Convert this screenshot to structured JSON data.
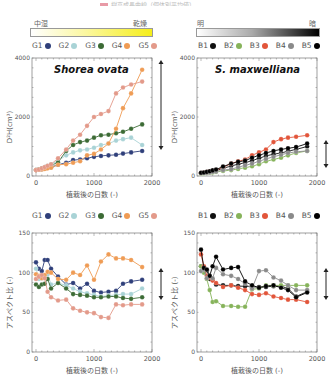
{
  "figure_title": "樹高成長曲線（個体別平均値）",
  "left_panel": {
    "gradient": {
      "left_label": "中湿",
      "right_label": "乾燥",
      "from": "#ffffff",
      "to": "#f5f000"
    },
    "legend": [
      {
        "label": "G1",
        "color": "#2f3f7a"
      },
      {
        "label": "G2",
        "color": "#a9d3d6"
      },
      {
        "label": "G3",
        "color": "#3c6b35"
      },
      {
        "label": "G4",
        "color": "#ef9c55"
      },
      {
        "label": "G5",
        "color": "#e39a8a"
      }
    ]
  },
  "right_panel": {
    "gradient": {
      "left_label": "明",
      "right_label": "暗",
      "from": "#ffffff",
      "to": "#000000"
    },
    "legend": [
      {
        "label": "B1",
        "color": "#111111"
      },
      {
        "label": "B2",
        "color": "#86b35a"
      },
      {
        "label": "B3",
        "color": "#e2553a"
      },
      {
        "label": "B4",
        "color": "#8a8a8a"
      },
      {
        "label": "B5",
        "color": "#000000"
      }
    ]
  },
  "axes_text": {
    "xlabel": "植栽後の日数 (-)",
    "ylabel_top": "D²H(cm³)",
    "ylabel_bottom": "アスペクト比 (-)",
    "x_ticks": [
      "0",
      "1000",
      "2000"
    ],
    "y_ticks_top": [
      "0",
      "2000",
      "4000"
    ],
    "y_ticks_bottom": [
      "0",
      "50",
      "100",
      "150"
    ]
  },
  "chart_data": [
    {
      "type": "line",
      "title": "Shorea ovata",
      "xlabel": "植栽後の日数 (-)",
      "ylabel": "D²H(cm³)",
      "xlim": [
        0,
        2000
      ],
      "ylim": [
        0,
        4000
      ],
      "x": [
        0,
        50,
        100,
        150,
        200,
        260,
        380,
        520,
        640,
        760,
        880,
        1000,
        1120,
        1250,
        1380,
        1500,
        1640,
        1830
      ],
      "series": [
        {
          "name": "G1",
          "color": "#2f3f7a",
          "values": [
            200,
            210,
            230,
            250,
            280,
            300,
            380,
            450,
            540,
            560,
            600,
            650,
            680,
            700,
            720,
            760,
            800,
            850
          ]
        },
        {
          "name": "G2",
          "color": "#a9d3d6",
          "values": [
            200,
            230,
            260,
            300,
            350,
            400,
            520,
            700,
            800,
            870,
            900,
            960,
            1050,
            1100,
            1200,
            1250,
            1300,
            1050
          ]
        },
        {
          "name": "G3",
          "color": "#3c6b35",
          "values": [
            200,
            220,
            250,
            280,
            330,
            360,
            460,
            850,
            1050,
            1150,
            1200,
            1300,
            1380,
            1400,
            1450,
            1500,
            1600,
            1750
          ]
        },
        {
          "name": "G4",
          "color": "#ef9c55",
          "values": [
            200,
            210,
            220,
            240,
            260,
            280,
            380,
            400,
            450,
            500,
            700,
            750,
            900,
            1100,
            1600,
            2300,
            2800,
            3600
          ]
        },
        {
          "name": "G5",
          "color": "#e39a8a",
          "values": [
            200,
            220,
            260,
            300,
            350,
            400,
            600,
            900,
            1200,
            1400,
            1700,
            2000,
            2100,
            2200,
            2800,
            3000,
            3100,
            3200
          ]
        }
      ],
      "annotation": "range arrow (double-headed) at right"
    },
    {
      "type": "line",
      "title": "S. maxwelliana",
      "xlabel": "植栽後の日数 (-)",
      "ylabel": "D²H(cm³)",
      "xlim": [
        0,
        2000
      ],
      "ylim": [
        0,
        4000
      ],
      "x": [
        0,
        50,
        100,
        150,
        200,
        260,
        380,
        520,
        640,
        760,
        880,
        1000,
        1120,
        1250,
        1380,
        1500,
        1640,
        1830
      ],
      "series": [
        {
          "name": "B1",
          "color": "#111111",
          "values": [
            100,
            110,
            120,
            140,
            160,
            180,
            260,
            340,
            400,
            450,
            520,
            600,
            680,
            740,
            780,
            840,
            900,
            1000
          ]
        },
        {
          "name": "B2",
          "color": "#86b35a",
          "values": [
            80,
            90,
            100,
            110,
            120,
            140,
            170,
            200,
            240,
            280,
            330,
            400,
            500,
            560,
            620,
            700,
            780,
            850
          ]
        },
        {
          "name": "B3",
          "color": "#e2553a",
          "values": [
            100,
            110,
            130,
            150,
            180,
            200,
            300,
            420,
            500,
            560,
            700,
            800,
            900,
            1150,
            1250,
            1300,
            1330,
            1380
          ]
        },
        {
          "name": "B4",
          "color": "#8a8a8a",
          "values": [
            90,
            100,
            110,
            120,
            140,
            150,
            200,
            230,
            300,
            360,
            420,
            500,
            580,
            650,
            720,
            780,
            820,
            850
          ]
        },
        {
          "name": "B5",
          "color": "#000000",
          "values": [
            110,
            120,
            140,
            160,
            190,
            220,
            320,
            420,
            480,
            520,
            620,
            700,
            780,
            850,
            900,
            940,
            980,
            1100
          ]
        }
      ],
      "annotation": "range arrow (double-headed) at right"
    },
    {
      "type": "line",
      "title": "",
      "xlabel": "植栽後の日数 (-)",
      "ylabel": "アスペクト比 (-)",
      "xlim": [
        0,
        2000
      ],
      "ylim": [
        0,
        150
      ],
      "x": [
        0,
        50,
        100,
        150,
        200,
        260,
        380,
        520,
        640,
        760,
        880,
        1000,
        1120,
        1250,
        1380,
        1500,
        1640,
        1830
      ],
      "series": [
        {
          "name": "G1",
          "color": "#2f3f7a",
          "values": [
            113,
            105,
            102,
            116,
            116,
            105,
            95,
            85,
            87,
            80,
            86,
            77,
            75,
            76,
            77,
            86,
            89,
            91
          ]
        },
        {
          "name": "G2",
          "color": "#a9d3d6",
          "values": [
            105,
            92,
            93,
            95,
            98,
            85,
            87,
            84,
            80,
            76,
            74,
            72,
            70,
            71,
            72,
            73,
            73,
            80
          ]
        },
        {
          "name": "G3",
          "color": "#3c6b35",
          "values": [
            85,
            82,
            85,
            86,
            92,
            80,
            87,
            80,
            73,
            72,
            71,
            69,
            69,
            70,
            70,
            68,
            67,
            69
          ]
        },
        {
          "name": "G4",
          "color": "#ef9c55",
          "values": [
            98,
            96,
            93,
            97,
            101,
            100,
            92,
            91,
            100,
            97,
            109,
            91,
            114,
            123,
            118,
            118,
            116,
            107
          ]
        },
        {
          "name": "G5",
          "color": "#e39a8a",
          "values": [
            92,
            95,
            97,
            93,
            76,
            69,
            65,
            66,
            55,
            52,
            50,
            49,
            44,
            43,
            60,
            59,
            60,
            60
          ]
        }
      ],
      "annotation": "range arrow (double-headed) at right"
    },
    {
      "type": "line",
      "title": "",
      "xlabel": "植栽後の日数 (-)",
      "ylabel": "アスペクト比 (-)",
      "xlim": [
        0,
        2000
      ],
      "ylim": [
        0,
        150
      ],
      "x": [
        0,
        50,
        100,
        150,
        200,
        260,
        380,
        520,
        640,
        760,
        880,
        1000,
        1120,
        1250,
        1380,
        1500,
        1640,
        1830
      ],
      "series": [
        {
          "name": "B1",
          "color": "#111111",
          "values": [
            108,
            104,
            103,
            92,
            91,
            85,
            84,
            84,
            83,
            83,
            82,
            82,
            82,
            83,
            83,
            80,
            70,
            76
          ]
        },
        {
          "name": "B2",
          "color": "#86b35a",
          "values": [
            108,
            100,
            92,
            78,
            63,
            64,
            58,
            58,
            57,
            57,
            79,
            80,
            84,
            84,
            84,
            84,
            84,
            84
          ]
        },
        {
          "name": "B3",
          "color": "#e2553a",
          "values": [
            123,
            108,
            96,
            94,
            90,
            87,
            82,
            84,
            81,
            78,
            73,
            72,
            74,
            70,
            68,
            66,
            66,
            63
          ]
        },
        {
          "name": "B4",
          "color": "#8a8a8a",
          "values": [
            102,
            104,
            93,
            96,
            93,
            106,
            98,
            96,
            92,
            86,
            80,
            102,
            103,
            94,
            90,
            84,
            78,
            78
          ]
        },
        {
          "name": "B5",
          "color": "#000000",
          "values": [
            129,
            106,
            104,
            96,
            108,
            120,
            104,
            106,
            107,
            89,
            84,
            81,
            83,
            84,
            81,
            78,
            69,
            75
          ]
        }
      ],
      "annotation": "range arrow (double-headed) at right"
    }
  ]
}
